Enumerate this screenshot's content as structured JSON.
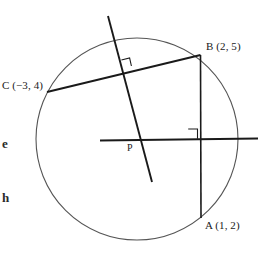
{
  "figure": {
    "type": "circle-geometry-diagram",
    "background_color": "#ffffff",
    "stroke_color": "#1a1a1a",
    "circle_stroke_color": "#555555"
  },
  "labels": {
    "point_b": "B (2, 5)",
    "point_c": "C (−3, 4)",
    "point_a": "A (1, 2)",
    "center_p": "P"
  },
  "margin_text": {
    "line_one": "e",
    "line_two": "h"
  },
  "geometry": {
    "circle": {
      "cx": 137,
      "cy": 139,
      "r": 101
    },
    "points": {
      "A": {
        "x": 201,
        "y": 218
      },
      "B": {
        "x": 200,
        "y": 55
      },
      "C": {
        "x": 47,
        "y": 92
      },
      "P": {
        "x": 137,
        "y": 140
      }
    },
    "chord_ab": {
      "x1": 200,
      "y1": 55,
      "x2": 201,
      "y2": 218
    },
    "chord_cb": {
      "x1": 47,
      "y1": 92,
      "x2": 200,
      "y2": 55
    },
    "perpendicular_bisector_cb": {
      "x1": 108,
      "y1": 16,
      "x2": 152,
      "y2": 182
    },
    "perpendicular_bisector_ab": {
      "x1": 100,
      "y1": 140,
      "x2": 258,
      "y2": 138
    },
    "right_angle_markers": [
      {
        "name": "right-angle-cb",
        "x": 124,
        "y": 63
      },
      {
        "name": "right-angle-ab",
        "x": 192,
        "y": 128
      }
    ]
  }
}
